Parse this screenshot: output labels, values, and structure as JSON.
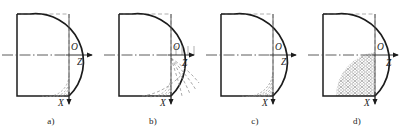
{
  "figure": {
    "name": "quarter-circle-profile-series",
    "panel_count": 4,
    "colors": {
      "outline": "#1c1c1c",
      "dashed_construction": "#8a8a8a",
      "axis": "#4a4a4a",
      "hatch": "#7c7c7c",
      "background": "#ffffff"
    }
  },
  "panels": [
    {
      "id": "a",
      "caption": "a)",
      "origin_label": "O",
      "z_axis_label": "Z",
      "x_axis_label": "X",
      "corner_fill": "sparse-dashed-arcs",
      "arc_count": 4,
      "has_external_curves": false
    },
    {
      "id": "b",
      "caption": "b)",
      "origin_label": "O",
      "z_axis_label": "Z",
      "x_axis_label": "X",
      "corner_fill": "dashed-arcs-extended-outward",
      "arc_count": 5,
      "has_external_curves": true
    },
    {
      "id": "c",
      "caption": "c)",
      "origin_label": "O",
      "z_axis_label": "Z",
      "x_axis_label": "X",
      "corner_fill": "dense-dashed-arcs",
      "arc_count": 6,
      "has_external_curves": false
    },
    {
      "id": "d",
      "caption": "d)",
      "origin_label": "O",
      "z_axis_label": "Z",
      "x_axis_label": "X",
      "corner_fill": "dense-crosshatch-rubble",
      "arc_count": 0,
      "has_external_curves": false
    }
  ]
}
